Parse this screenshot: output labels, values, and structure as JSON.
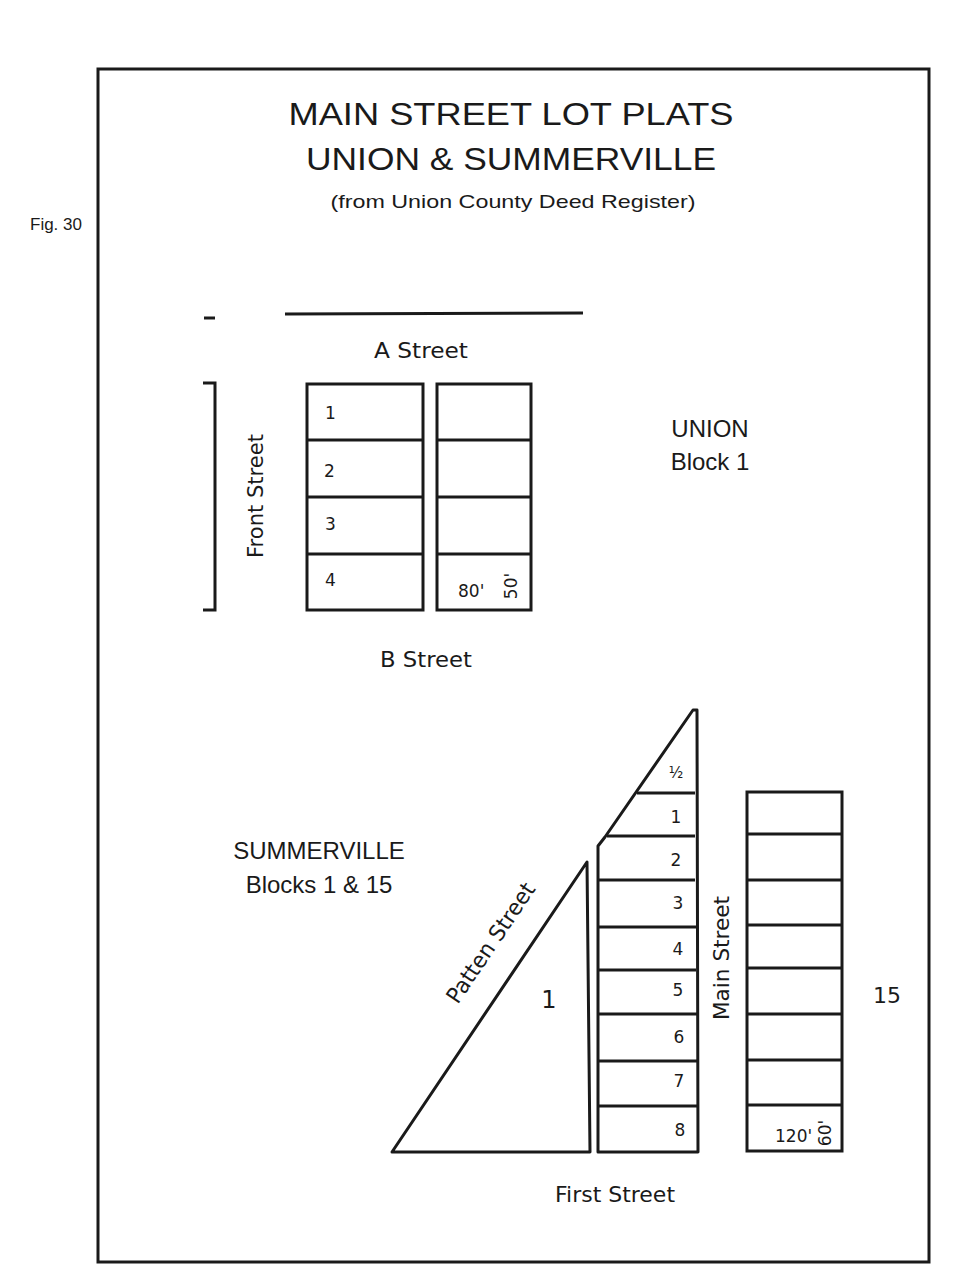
{
  "figure_label": "Fig. 30",
  "title": {
    "line1": "MAIN STREET LOT PLATS",
    "line2": "UNION & SUMMERVILLE",
    "source": "(from Union County Deed Register)"
  },
  "union": {
    "label_town": "UNION",
    "label_block": "Block 1",
    "streets": {
      "top": "A Street",
      "bottom": "B Street",
      "left": "Front Street"
    },
    "lot_numbers": [
      "1",
      "2",
      "3",
      "4"
    ],
    "dimensions": {
      "depth": "80'",
      "frontage": "50'"
    }
  },
  "summerville": {
    "label_town": "SUMMERVILLE",
    "label_blocks": "Blocks 1 & 15",
    "streets": {
      "diagonal": "Patten Street",
      "middle": "Main Street",
      "bottom": "First Street"
    },
    "block_1_label": "1",
    "block_15_label": "15",
    "lot_numbers": [
      "½",
      "1",
      "2",
      "3",
      "4",
      "5",
      "6",
      "7",
      "8"
    ],
    "dimensions": {
      "depth": "120'",
      "frontage": "60'"
    }
  }
}
